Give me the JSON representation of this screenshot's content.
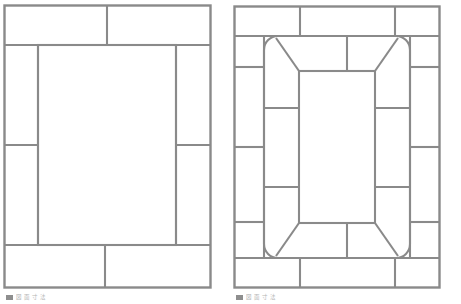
{
  "page": {
    "background_color": "#ffffff",
    "line_color": "#8a8a8a",
    "width": 461,
    "height": 304
  },
  "figures": [
    {
      "id": "left",
      "name": "rectangular-border-paver-layout",
      "caption_text": "図 面 寸 法",
      "caption_swatch_color": "#8e8e8e",
      "frame": {
        "x": 4,
        "y": 5,
        "width": 207,
        "height": 283
      },
      "field": {
        "x": 38,
        "y": 45,
        "width": 138,
        "height": 200
      },
      "bands": {
        "top": {
          "dividers_x": [
            107
          ]
        },
        "bottom": {
          "dividers_x": [
            105
          ]
        },
        "left": {
          "dividers_y": [
            145
          ]
        },
        "right": {
          "dividers_y": [
            145
          ]
        }
      }
    },
    {
      "id": "right",
      "name": "rounded-miter-inner-ring-paver-layout",
      "caption_text": "図 面 寸 法",
      "caption_swatch_color": "#8e8e8e",
      "frame": {
        "x": 234,
        "y": 6,
        "width": 206,
        "height": 282
      },
      "outer_band": {
        "top_dividers_x": [
          300,
          395
        ],
        "bottom_dividers_x": [
          300,
          395
        ],
        "left_dividers_y": [
          67,
          147,
          222
        ],
        "right_dividers_y": [
          67,
          147,
          222
        ]
      },
      "inner_ring": {
        "outer": {
          "x": 264,
          "y": 36,
          "width": 146,
          "height": 222,
          "corner_radius": 12
        },
        "inner": {
          "x": 299,
          "y": 71,
          "width": 76,
          "height": 152
        },
        "miter": "45-degree corner joints",
        "top_dividers_x": [
          347
        ],
        "bottom_dividers_x": [
          347
        ],
        "left_dividers_y": [
          108,
          187
        ],
        "right_dividers_y": [
          108,
          187
        ]
      }
    }
  ]
}
